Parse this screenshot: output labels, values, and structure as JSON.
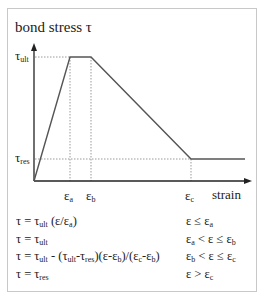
{
  "diagram": {
    "title": "bond stress τ",
    "x_axis_label": "strain",
    "y_ticks": [
      {
        "base": "τ",
        "sub": "ult"
      },
      {
        "base": "τ",
        "sub": "res"
      }
    ],
    "x_ticks": [
      {
        "base": "ε",
        "sub": "a"
      },
      {
        "base": "ε",
        "sub": "b"
      },
      {
        "base": "ε",
        "sub": "c"
      }
    ],
    "curve_points": [
      [
        0,
        0
      ],
      [
        "ε_a",
        "τ_ult"
      ],
      [
        "ε_b",
        "τ_ult"
      ],
      [
        "ε_c",
        "τ_res"
      ],
      [
        "beyond",
        "τ_res"
      ]
    ],
    "line_color": "#555555",
    "guide_color": "#999999"
  },
  "equations": [
    {
      "lhs": "τ = τ",
      "parts": [
        {
          "t": "τ = τ"
        },
        {
          "s": "ult"
        },
        {
          "t": " (ε/ε"
        },
        {
          "s": "a"
        },
        {
          "t": ")"
        }
      ],
      "condition_parts": [
        {
          "t": "ε  ≤ ε"
        },
        {
          "s": "a"
        }
      ]
    },
    {
      "parts": [
        {
          "t": "τ = τ"
        },
        {
          "s": "ult"
        }
      ],
      "condition_parts": [
        {
          "t": "ε"
        },
        {
          "s": "a"
        },
        {
          "t": " < ε ≤ ε"
        },
        {
          "s": "b"
        }
      ]
    },
    {
      "parts": [
        {
          "t": "τ = τ"
        },
        {
          "s": "ult"
        },
        {
          "t": " - (τ"
        },
        {
          "s": "ult"
        },
        {
          "t": "-τ"
        },
        {
          "s": "res"
        },
        {
          "t": ")(ε-ε"
        },
        {
          "s": "b"
        },
        {
          "t": ")/(ε"
        },
        {
          "s": "c"
        },
        {
          "t": "-ε"
        },
        {
          "s": "b"
        },
        {
          "t": ")"
        }
      ],
      "condition_parts": [
        {
          "t": "ε"
        },
        {
          "s": "b"
        },
        {
          "t": " < ε ≤ ε"
        },
        {
          "s": "c"
        }
      ]
    },
    {
      "parts": [
        {
          "t": "τ = τ"
        },
        {
          "s": "res"
        }
      ],
      "condition_parts": [
        {
          "t": "ε  > ε"
        },
        {
          "s": "c"
        }
      ]
    }
  ]
}
